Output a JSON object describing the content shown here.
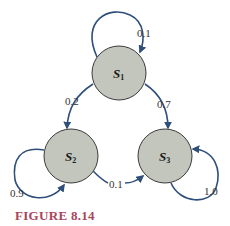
{
  "diagram": {
    "type": "markov-chain-state-transition",
    "colors": {
      "node_fill": "#c3c6bd",
      "node_stroke": "#3a3a3a",
      "edge": "#2f4f7a",
      "caption": "#a8455a"
    },
    "nodes": [
      {
        "id": "S1",
        "letter": "S",
        "sub": "1"
      },
      {
        "id": "S2",
        "letter": "S",
        "sub": "2"
      },
      {
        "id": "S3",
        "letter": "S",
        "sub": "3"
      }
    ],
    "edges": [
      {
        "from": "S1",
        "to": "S1",
        "prob": "0.1"
      },
      {
        "from": "S1",
        "to": "S2",
        "prob": "0.2"
      },
      {
        "from": "S1",
        "to": "S3",
        "prob": "0.7"
      },
      {
        "from": "S2",
        "to": "S2",
        "prob": "0.9"
      },
      {
        "from": "S2",
        "to": "S3",
        "prob": "0.1"
      },
      {
        "from": "S3",
        "to": "S3",
        "prob": "1.0"
      }
    ],
    "caption": "FIGURE 8.14"
  }
}
